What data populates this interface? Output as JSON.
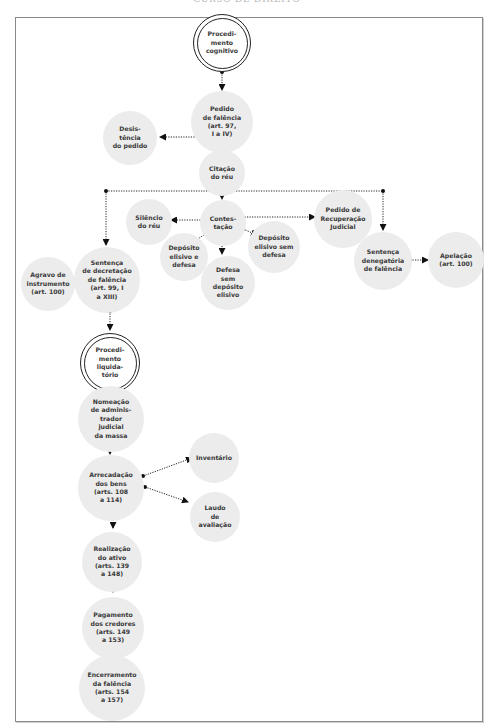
{
  "header": {
    "running_title": "CURSO DE DIREITO"
  },
  "diagram": {
    "nodes": {
      "procedimento_cognitivo": "Procedi-\nmento\ncognitivo",
      "pedido_falencia": "Pedido\nde falência\n(art. 97,\nI a IV)",
      "desistencia": "Desis-\ntência\ndo pedido",
      "citacao": "Citação\ndo réu",
      "silencio": "Silêncio\ndo réu",
      "contestacao": "Contes-\ntação",
      "recuperacao": "Pedido de\nRecuperação\nJudicial",
      "deposito_defesa": "Depósito\nelisivo e\ndefesa",
      "deposito_sem_defesa": "Depósito\nelisivo sem\ndefesa",
      "defesa_sem_deposito": "Defesa\nsem\ndepósito\nelisivo",
      "sentenca_decretacao": "Sentença\nde decretação\nde falência\n(art. 99, I\na XIII)",
      "agravo": "Agravo de\ninstrumento\n(art. 100)",
      "sentenca_denegatoria": "Sentença\ndenegatória\nde falência",
      "apelacao": "Apelação\n(art. 100)",
      "procedimento_liquidatorio": "Procedi-\nmento\nliquida-\ntório",
      "nomeacao": "Nomeação\nde adminis-\ntrador\njudicial\nda massa",
      "arrecadacao": "Arrecadação\ndos bens\n(arts. 108\na 114)",
      "inventario": "Inventário",
      "laudo": "Laudo\nde\navaliação",
      "realizacao": "Realização\ndo ativo\n(arts. 139\na 148)",
      "pagamento": "Pagamento\ndos credores\n(arts. 149\na 153)",
      "encerramento": "Encerramento\nda falência\n(arts. 154\na 157)"
    },
    "edges": [
      [
        "procedimento_cognitivo",
        "pedido_falencia"
      ],
      [
        "pedido_falencia",
        "desistencia"
      ],
      [
        "pedido_falencia",
        "citacao"
      ],
      [
        "citacao",
        "contestacao"
      ],
      [
        "citacao",
        "sentenca_decretacao"
      ],
      [
        "citacao",
        "sentenca_denegatoria"
      ],
      [
        "contestacao",
        "silencio"
      ],
      [
        "contestacao",
        "recuperacao"
      ],
      [
        "contestacao",
        "deposito_defesa"
      ],
      [
        "contestacao",
        "deposito_sem_defesa"
      ],
      [
        "contestacao",
        "defesa_sem_deposito"
      ],
      [
        "sentenca_decretacao",
        "agravo"
      ],
      [
        "sentenca_denegatoria",
        "apelacao"
      ],
      [
        "sentenca_decretacao",
        "procedimento_liquidatorio"
      ],
      [
        "procedimento_liquidatorio",
        "nomeacao"
      ],
      [
        "nomeacao",
        "arrecadacao"
      ],
      [
        "arrecadacao",
        "inventario"
      ],
      [
        "arrecadacao",
        "laudo"
      ],
      [
        "arrecadacao",
        "realizacao"
      ],
      [
        "realizacao",
        "pagamento"
      ],
      [
        "pagamento",
        "encerramento"
      ]
    ],
    "colors": {
      "node_fill": "#ececec",
      "line": "#222222",
      "text": "#3a3a3a",
      "frame": "#8a8a8a"
    }
  }
}
